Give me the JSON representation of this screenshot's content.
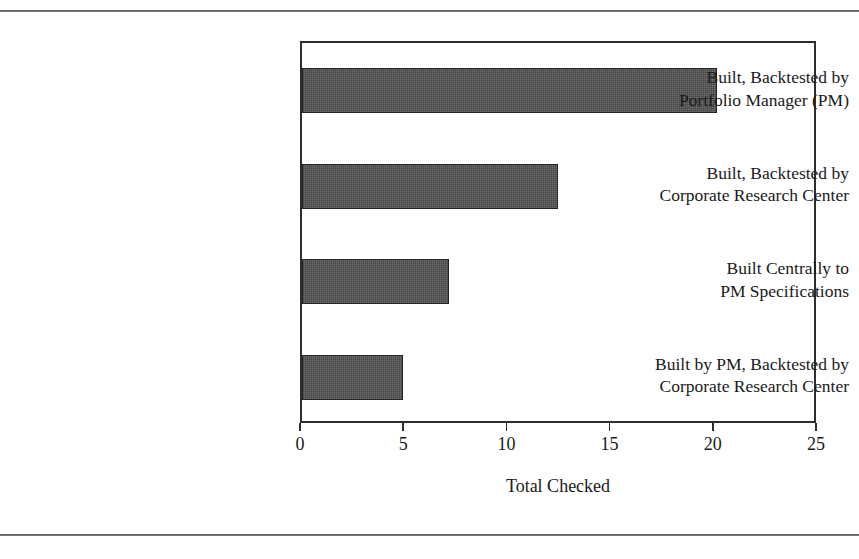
{
  "page": {
    "clipped_header_text": "",
    "background": "#ffffff",
    "rule_color": "#3a3a3a"
  },
  "chart_data": {
    "type": "bar",
    "orientation": "horizontal",
    "title": "",
    "xlabel": "Total Checked",
    "ylabel": "",
    "categories": [
      "Built, Backtested by Portfolio Manager (PM)",
      "Built, Backtested by Corporate Research Center",
      "Built Centrally to PM Specifications",
      "Built by PM, Backtested by Corporate Research Center"
    ],
    "category_lines": [
      [
        "Built, Backtested by",
        "Portfolio Manager (PM)"
      ],
      [
        "Built, Backtested by",
        "Corporate Research Center"
      ],
      [
        "Built Centrally to",
        "PM Specifications"
      ],
      [
        "Built by PM, Backtested by",
        "Corporate Research Center"
      ]
    ],
    "values": [
      20.1,
      12.4,
      7.1,
      4.9
    ],
    "xlim": [
      0,
      25
    ],
    "xticks": [
      0,
      5,
      10,
      15,
      20,
      25
    ],
    "xtick_labels": [
      "0",
      "5",
      "10",
      "15",
      "20",
      "25"
    ],
    "grid": false,
    "legend": false,
    "bar_color": "#4d4d4d",
    "bar_edge_color": "#242424",
    "frame_color": "#2e2e2e"
  }
}
